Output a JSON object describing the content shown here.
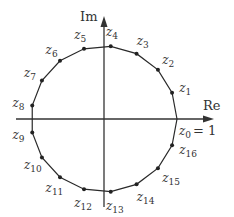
{
  "diagram": {
    "n": 17,
    "center": [
      104,
      119
    ],
    "radius": 73,
    "axes": {
      "x_label": "Re",
      "y_label": "Im",
      "x_range": [
        16,
        214
      ],
      "y_range": [
        16,
        207
      ]
    },
    "z0_annotation": "= 1",
    "points": [
      {
        "name": "z",
        "sub": "0"
      },
      {
        "name": "z",
        "sub": "1"
      },
      {
        "name": "z",
        "sub": "2"
      },
      {
        "name": "z",
        "sub": "3"
      },
      {
        "name": "z",
        "sub": "4"
      },
      {
        "name": "z",
        "sub": "5"
      },
      {
        "name": "z",
        "sub": "6"
      },
      {
        "name": "z",
        "sub": "7"
      },
      {
        "name": "z",
        "sub": "8"
      },
      {
        "name": "z",
        "sub": "9"
      },
      {
        "name": "z",
        "sub": "10"
      },
      {
        "name": "z",
        "sub": "11"
      },
      {
        "name": "z",
        "sub": "12"
      },
      {
        "name": "z",
        "sub": "13"
      },
      {
        "name": "z",
        "sub": "14"
      },
      {
        "name": "z",
        "sub": "15"
      },
      {
        "name": "z",
        "sub": "16"
      }
    ]
  }
}
